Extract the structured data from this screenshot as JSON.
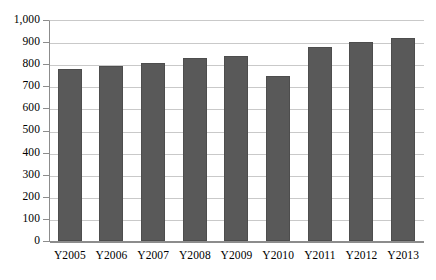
{
  "chart_data": {
    "type": "bar",
    "title": "",
    "xlabel": "",
    "ylabel": "",
    "categories": [
      "Y2005",
      "Y2006",
      "Y2007",
      "Y2008",
      "Y2009",
      "Y2010",
      "Y2011",
      "Y2012",
      "Y2013"
    ],
    "values": [
      780,
      790,
      805,
      830,
      835,
      745,
      880,
      900,
      920
    ],
    "ylim": [
      0,
      1000
    ],
    "ytick_values": [
      0,
      100,
      200,
      300,
      400,
      500,
      600,
      700,
      800,
      900,
      1000
    ],
    "ytick_labels": [
      "0",
      "100",
      "200",
      "300",
      "400",
      "500",
      "600",
      "700",
      "800",
      "900",
      "1,000"
    ],
    "grid": true,
    "legend": false,
    "series": [
      {
        "name": "",
        "color": "#595959",
        "values": [
          780,
          790,
          805,
          830,
          835,
          745,
          880,
          900,
          920
        ]
      }
    ]
  },
  "style": {
    "bar_color": "#595959",
    "grid_color": "#c9c9c9",
    "axis_color": "#8c8c8c",
    "background": "#ffffff"
  }
}
